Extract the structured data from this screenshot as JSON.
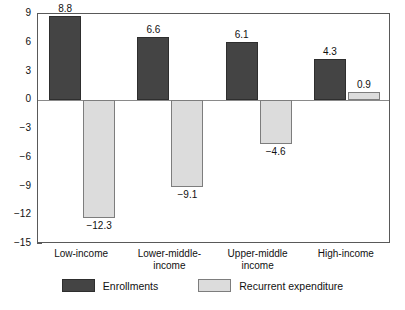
{
  "chart_data": {
    "type": "bar",
    "title": "",
    "subtitle": "",
    "xlabel": "",
    "ylabel": "",
    "ylim": [
      -15,
      9
    ],
    "grid": false,
    "legend_position": "bottom",
    "categories": [
      "Low-income",
      "Lower-middle-\nincome",
      "Upper-middle\nincome",
      "High-income"
    ],
    "ytick_labels": [
      "9",
      "6",
      "3",
      "0",
      "−3",
      "−6",
      "−9",
      "−12",
      "−15"
    ],
    "ytick_values": [
      9,
      6,
      3,
      0,
      -3,
      -6,
      -9,
      -12,
      -15
    ],
    "series": [
      {
        "name": "Enrollments",
        "color": "#444444",
        "values": [
          8.8,
          6.6,
          6.1,
          4.3
        ],
        "labels": [
          "8.8",
          "6.6",
          "6.1",
          "4.3"
        ]
      },
      {
        "name": "Recurrent expenditure",
        "color": "#dcdcdc",
        "values": [
          -12.3,
          -9.1,
          -4.6,
          0.9
        ],
        "labels": [
          "−12.3",
          "−9.1",
          "−4.6",
          "0.9"
        ]
      }
    ]
  },
  "legend": {
    "items": [
      {
        "label": "Enrollments",
        "color": "#444444"
      },
      {
        "label": "Recurrent expenditure",
        "color": "#dcdcdc"
      }
    ]
  },
  "colors": {
    "enrollments": "#444444",
    "expenditure": "#dcdcdc",
    "axis": "#595959",
    "text": "#111111",
    "background": "#ffffff"
  }
}
